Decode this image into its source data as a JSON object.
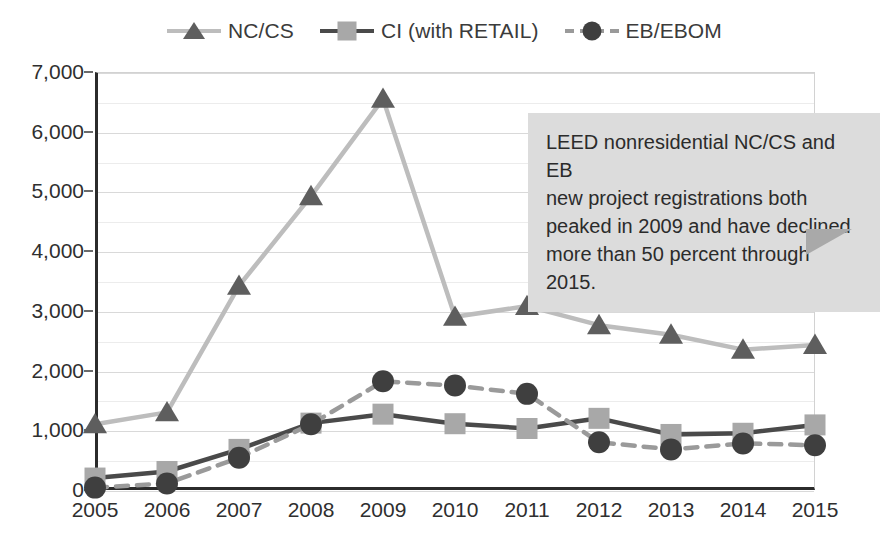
{
  "chart_data": {
    "type": "line",
    "title": "",
    "subtitle": "",
    "xlabel": "",
    "ylabel": "",
    "categories": [
      "2005",
      "2006",
      "2007",
      "2008",
      "2009",
      "2010",
      "2011",
      "2012",
      "2013",
      "2014",
      "2015"
    ],
    "x": [
      2005,
      2006,
      2007,
      2008,
      2009,
      2010,
      2011,
      2012,
      2013,
      2014,
      2015
    ],
    "ylim": [
      0,
      7000
    ],
    "xlim": [
      2005,
      2015
    ],
    "y_ticks": [
      "0",
      "1,000",
      "2,000",
      "3,000",
      "4,000",
      "5,000",
      "6,000",
      "7,000"
    ],
    "y_tick_values": [
      0,
      1000,
      2000,
      3000,
      4000,
      5000,
      6000,
      7000
    ],
    "y_tick_step": 1000,
    "minor_gridline_step": 500,
    "grid": true,
    "legend_position": "top-center",
    "series": [
      {
        "name": "NC/CS",
        "marker": "triangle",
        "line_style": "solid",
        "line_color": "#bdbdbd",
        "marker_color": "#5e5e5e",
        "values": [
          1100,
          1300,
          3420,
          4920,
          6550,
          2900,
          3080,
          2760,
          2600,
          2350,
          2430
        ]
      },
      {
        "name": "CI (with RETAIL)",
        "marker": "square",
        "line_style": "solid",
        "line_color": "#4a4a4a",
        "marker_color": "#a8a8a8",
        "values": [
          200,
          310,
          680,
          1120,
          1270,
          1110,
          1030,
          1200,
          930,
          950,
          1090
        ]
      },
      {
        "name": "EB/EBOM",
        "marker": "circle",
        "line_style": "dashed",
        "line_color": "#9a9a9a",
        "marker_color": "#3f3f3f",
        "values": [
          40,
          110,
          540,
          1100,
          1820,
          1750,
          1610,
          800,
          680,
          780,
          750
        ]
      }
    ],
    "annotations": [
      {
        "id": "callout-1",
        "text": "LEED nonresidential NC/CS and EB new project registrations both peaked in 2009 and have declined more than 50 percent through 2015.",
        "background": "#dcdcdc",
        "tail_color": "#a9a9a9"
      }
    ]
  },
  "legend": {
    "items": [
      {
        "label": "NC/CS",
        "marker_icon": "triangle-marker-icon"
      },
      {
        "label": "CI (with RETAIL)",
        "marker_icon": "square-marker-icon"
      },
      {
        "label": "EB/EBOM",
        "marker_icon": "circle-marker-icon"
      }
    ]
  },
  "callout": {
    "line1": "LEED nonresidential NC/CS and EB",
    "line2": "new project registrations both",
    "line3": "peaked in 2009 and have declined",
    "line4": "more than 50 percent through 2015."
  },
  "colors": {
    "nc_cs_line": "#bdbdbd",
    "nc_cs_marker": "#5e5e5e",
    "ci_line": "#4a4a4a",
    "ci_marker": "#a8a8a8",
    "eb_line": "#9a9a9a",
    "eb_marker": "#3f3f3f",
    "axis": "#2b2b2b",
    "gridline": "#d9d9d9",
    "callout_bg": "#dcdcdc",
    "callout_tail": "#a9a9a9",
    "text": "#2f2f2f",
    "background": "#ffffff"
  }
}
